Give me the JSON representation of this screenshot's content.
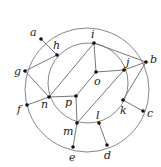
{
  "diagram": {
    "circles": [
      {
        "name": "outer",
        "cx": 87,
        "cy": 90,
        "r": 62
      },
      {
        "name": "inner",
        "cx": 88,
        "cy": 83,
        "r": 40
      }
    ],
    "points": [
      {
        "id": "a",
        "x": 41,
        "y": 39,
        "lx": 30,
        "ly": 36
      },
      {
        "id": "b",
        "x": 146,
        "y": 62,
        "lx": 150,
        "ly": 63
      },
      {
        "id": "c",
        "x": 143,
        "y": 111,
        "lx": 147,
        "ly": 117
      },
      {
        "id": "d",
        "x": 107,
        "y": 145,
        "lx": 104,
        "ly": 159
      },
      {
        "id": "e",
        "x": 73,
        "y": 147,
        "lx": 69,
        "ly": 161
      },
      {
        "id": "f",
        "x": 27,
        "y": 105,
        "lx": 17,
        "ly": 113
      },
      {
        "id": "g",
        "x": 25,
        "y": 71,
        "lx": 14,
        "ly": 75
      },
      {
        "id": "h",
        "x": 57,
        "y": 55,
        "lx": 53,
        "ly": 49
      },
      {
        "id": "i",
        "x": 94,
        "y": 43,
        "lx": 91,
        "ly": 38
      },
      {
        "id": "j",
        "x": 124,
        "y": 70,
        "lx": 126,
        "ly": 66
      },
      {
        "id": "k",
        "x": 123,
        "y": 100,
        "lx": 120,
        "ly": 114
      },
      {
        "id": "l",
        "x": 99,
        "y": 123,
        "lx": 96,
        "ly": 119
      },
      {
        "id": "m",
        "x": 77,
        "y": 123,
        "lx": 63,
        "ly": 135
      },
      {
        "id": "n",
        "x": 49,
        "y": 97,
        "lx": 41,
        "ly": 108
      },
      {
        "id": "o",
        "x": 96,
        "y": 72,
        "lx": 94,
        "ly": 85
      },
      {
        "id": "p",
        "x": 76,
        "y": 96,
        "lx": 65,
        "ly": 106
      }
    ],
    "edges": [
      [
        "a",
        "h"
      ],
      [
        "h",
        "g"
      ],
      [
        "g",
        "n"
      ],
      [
        "f",
        "n"
      ],
      [
        "n",
        "i"
      ],
      [
        "n",
        "p"
      ],
      [
        "i",
        "o"
      ],
      [
        "i",
        "b"
      ],
      [
        "o",
        "j"
      ],
      [
        "j",
        "b"
      ],
      [
        "j",
        "m"
      ],
      [
        "p",
        "m"
      ],
      [
        "p",
        "o"
      ],
      [
        "b",
        "k"
      ],
      [
        "k",
        "c"
      ],
      [
        "m",
        "e"
      ],
      [
        "l",
        "d"
      ]
    ]
  }
}
